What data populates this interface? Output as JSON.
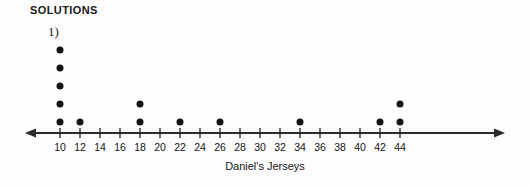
{
  "heading": "SOLUTIONS",
  "problem_number": "1)",
  "axis_title": "Daniel's Jerseys",
  "colors": {
    "ink": "#141414",
    "background": "#fdfdfd",
    "axis": "#2b2b2b"
  },
  "chart_data": {
    "type": "scatter",
    "plot_style": "dot-plot",
    "title": "",
    "xlabel": "Daniel's Jerseys",
    "ylabel": "",
    "grid": false,
    "legend": null,
    "xlim": [
      9,
      45
    ],
    "x_ticks": [
      10,
      12,
      14,
      16,
      18,
      20,
      22,
      24,
      26,
      28,
      30,
      32,
      34,
      36,
      38,
      40,
      42,
      44
    ],
    "tick_labels": [
      "10",
      "12",
      "14",
      "16",
      "18",
      "20",
      "22",
      "24",
      "26",
      "28",
      "30",
      "32",
      "34",
      "36",
      "38",
      "40",
      "42",
      "44"
    ],
    "axis_arrows": [
      "left",
      "right"
    ],
    "categories": [
      10,
      12,
      14,
      16,
      18,
      20,
      22,
      24,
      26,
      28,
      30,
      32,
      34,
      36,
      38,
      40,
      42,
      44
    ],
    "values": [
      5,
      1,
      0,
      0,
      2,
      0,
      1,
      0,
      1,
      0,
      0,
      0,
      1,
      0,
      0,
      0,
      1,
      2
    ],
    "total_dots": 14,
    "points": [
      {
        "x": 10,
        "count": 5
      },
      {
        "x": 12,
        "count": 1
      },
      {
        "x": 18,
        "count": 2
      },
      {
        "x": 22,
        "count": 1
      },
      {
        "x": 26,
        "count": 1
      },
      {
        "x": 34,
        "count": 1
      },
      {
        "x": 42,
        "count": 1
      },
      {
        "x": 44,
        "count": 2
      }
    ]
  },
  "geometry": {
    "axis_y": 133,
    "first_tick_x": 60,
    "tick_spacing": 20,
    "left_arrow_x": 25,
    "right_arrow_x": 505,
    "dot_base_y": 122,
    "dot_spacing": 18
  }
}
